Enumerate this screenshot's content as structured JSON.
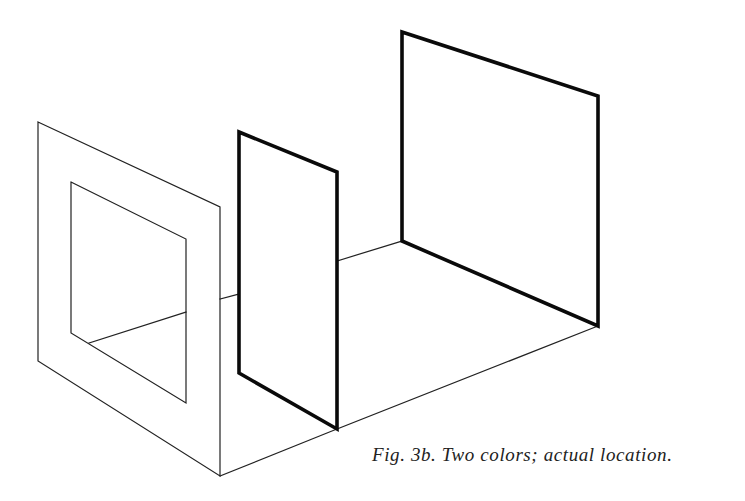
{
  "figure": {
    "caption": "Fig. 3b. Two colors; actual location.",
    "colors": {
      "background": "#ffffff",
      "line": "#0a0a0a",
      "thin_line": "#222222"
    },
    "shapes": {
      "front_frame_outer": [
        [
          38,
          122
        ],
        [
          220,
          207
        ],
        [
          220,
          476
        ],
        [
          38,
          361
        ]
      ],
      "front_frame_inner": [
        [
          71,
          182
        ],
        [
          186,
          239
        ],
        [
          186,
          403
        ],
        [
          71,
          333
        ]
      ],
      "middle_panel": [
        [
          239,
          132
        ],
        [
          337,
          172
        ],
        [
          337,
          429
        ],
        [
          239,
          373
        ]
      ],
      "back_panel": [
        [
          402,
          32
        ],
        [
          598,
          96
        ],
        [
          598,
          326
        ],
        [
          402,
          241
        ]
      ],
      "floor_lines": [
        [
          [
            89,
            343
          ],
          [
            186,
            312
          ]
        ],
        [
          [
            220,
            299
          ],
          [
            239,
            294
          ]
        ],
        [
          [
            337,
            261
          ],
          [
            402,
            241
          ]
        ],
        [
          [
            220,
            476
          ],
          [
            337,
            429
          ]
        ],
        [
          [
            337,
            429
          ],
          [
            598,
            326
          ]
        ]
      ]
    }
  }
}
